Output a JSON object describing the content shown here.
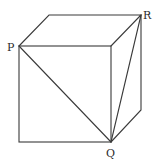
{
  "diagram": {
    "type": "cube-with-diagonals",
    "labels": {
      "P": "P",
      "Q": "Q",
      "R": "R"
    },
    "vertices": {
      "front_top_left": [
        19,
        46
      ],
      "front_top_right": [
        111,
        46
      ],
      "front_bottom_right": [
        111,
        142
      ],
      "front_bottom_left": [
        19,
        142
      ],
      "back_top_left": [
        49,
        15
      ],
      "back_top_right": [
        141,
        15
      ],
      "back_bottom_right": [
        141,
        110
      ]
    },
    "segments": [
      "PQ",
      "QR"
    ],
    "line_color": "#3a3a3a"
  }
}
